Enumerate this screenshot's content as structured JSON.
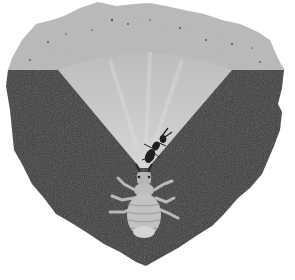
{
  "illustration": {
    "subject": "antlion larva in sand pit cross-section",
    "caption": "",
    "colors": {
      "background": "#ffffff",
      "surface_sand": "#b9b9b9",
      "cone_sand": "#c9c9c9",
      "ground": "#3b3b3b",
      "larva": "#bdbdbd",
      "prey": "#202020"
    }
  }
}
